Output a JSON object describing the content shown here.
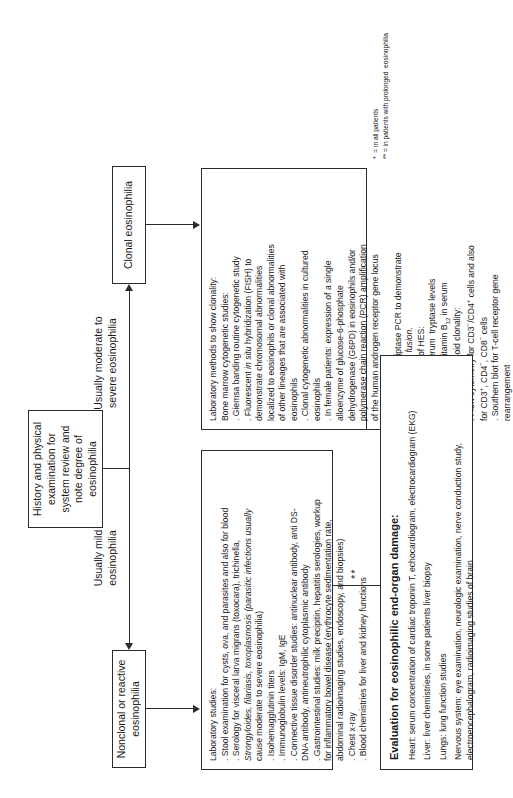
{
  "figure": {
    "orientation": "rotated-90-ccw",
    "type": "clinical-diagnostic-flowchart"
  },
  "nodes": {
    "start": {
      "label": "History and physical\nexamination for\nsystem review and\nnote degree  of\neosinophilia"
    },
    "reactive": {
      "label": "Nonclonal or reactive  eosinophilia"
    },
    "clonal": {
      "label": "Clonal eosinophilia"
    }
  },
  "edges": {
    "mild": "Usually mild\neosinophilia",
    "severe": "Usually moderate to\nsevere eosinophilia"
  },
  "reactive_panel": {
    "heading": "Laboratory studies:",
    "items": [
      ". Stool examination for cysts, ova, and parasites and also for blood",
      ". Serology for visceral larva migrans (toxocara), trichinella,",
      "Strongyloides, filariasis, toxoplasmosis (parasitic infections usually",
      "cause moderate to severe eosinophilia)",
      ". Isohemagglutinin titers",
      ". Immunoglobulin levels: IgM, IgE",
      ". Connective tissue disorder studies: antinuclear antibody, anti DS-",
      "DNA antibody, antineutrophilic cytoplasmic antibody",
      ". Gastrointestinal studies: milk precipitin, hepatitis serologies, workup",
      "for inflammatory bowel disease (erythrocyte sedimentation rate,",
      "abdominal radioimaging studies, endoscopy, and biopsies)",
      ". Chest x-ray",
      ". Blood chemistries for liver and kidney functions"
    ],
    "italic_lines": [
      2
    ]
  },
  "clonal_panel": {
    "heading": "Laboratory methods to show clonality:",
    "subheading": "Bone marrow cytogenetic studies:",
    "items": [
      ". Giemsa banding routine cytogenetic study",
      ". Fluorescent in situ hybridization (FISH) to",
      "demonstrate chromosomal abnormalities",
      "localized to eosinophils or clonal abnormalities",
      "of other lineages that are associated with",
      "eosinophils",
      ". Clonal cytogenetic abnormalities in cultured",
      "eosinophils",
      ". In female patients: expression of a single",
      "alloenzyme of glucose-6-phosphate",
      "dehydrogenase (G6PD) in eosinophils and/or",
      "polymerase chain reaction (PCR) amplification",
      "of the human androgen receptor gene locus",
      "(HUMARA)",
      ". Reverse transcriptase PCR to demonstrate",
      "FIP1L1-PDGFRA fusion."
    ],
    "second_heading": "Other evidences of HES:",
    "second_items": [
      ". High levels of serum  tryptase levels",
      ". High levels of  vitamin B12 in serum"
    ],
    "third_heading": "Studies for lymphoid clonality:",
    "third_items": [
      ". Flow cytometry for CD3−/CD4+ cells and also",
      "for CD3+, CD4−, CD8− cells",
      ". Southern blot for T-cell receptor gene",
      "rearrangement"
    ]
  },
  "evaluation_panel": {
    "title": "Evaluation for eosinophilic end-organ damage:",
    "lines": [
      "Heart: serum concentration of cardiac troponin T, echocardiogram, electrocardiogram (EKG)",
      "Liver: liver chemistries, in some patients liver biopsy",
      "Lungs: lung function studies",
      "Nervous system: eye examination, neurologic examination, nerve conduction study,\nelectroencephalogram, radioimaging studies of brain"
    ]
  },
  "markers": {
    "single_star": "*",
    "double_star": "**"
  },
  "footnotes": [
    "*  = in all patients",
    "** = in patients with prolonged  eosinophilia"
  ],
  "colors": {
    "ink": "#1a1a1a",
    "stroke": "#2b2b2b",
    "background": "#ffffff"
  }
}
